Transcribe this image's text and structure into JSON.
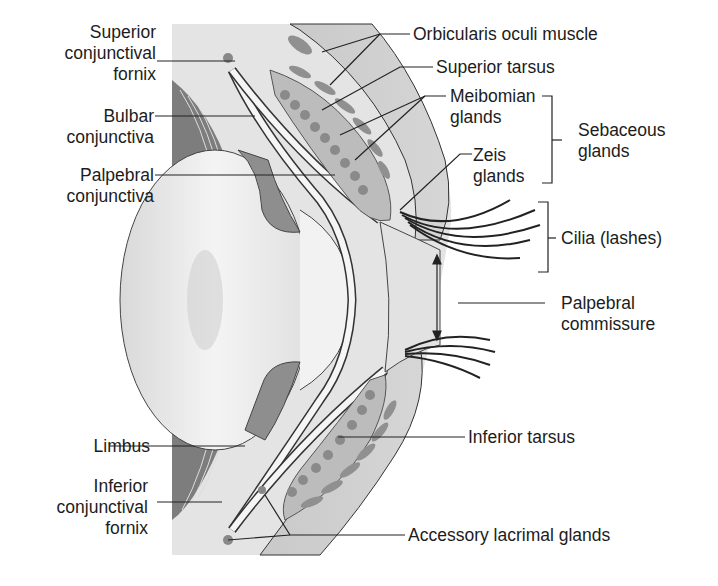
{
  "figure": {
    "colors": {
      "background": "#ffffff",
      "skin": "#cfcfcf",
      "muscle": "#9a9a9a",
      "gland": "#8c8c8c",
      "tarsus": "#bdbdbd",
      "eyeball": "#ececec",
      "dark_tissue": "#7a7a7a",
      "line": "#222222"
    }
  },
  "labels": {
    "left": [
      {
        "id": "superior-conjunctival-fornix",
        "lines": [
          "Superior",
          "conjunctival",
          "fornix"
        ]
      },
      {
        "id": "bulbar-conjunctiva",
        "lines": [
          "Bulbar",
          "conjunctiva"
        ]
      },
      {
        "id": "palpebral-conjunctiva",
        "lines": [
          "Palpebral",
          "conjunctiva"
        ]
      },
      {
        "id": "limbus",
        "lines": [
          "Limbus"
        ]
      },
      {
        "id": "inferior-conjunctival-fornix",
        "lines": [
          "Inferior",
          "conjunctival",
          "fornix"
        ]
      }
    ],
    "right": [
      {
        "id": "orbicularis-oculi-muscle",
        "lines": [
          "Orbicularis oculi muscle"
        ]
      },
      {
        "id": "superior-tarsus",
        "lines": [
          "Superior tarsus"
        ]
      },
      {
        "id": "meibomian-glands",
        "lines": [
          "Meibomian",
          "glands"
        ]
      },
      {
        "id": "zeis-glands",
        "lines": [
          "Zeis",
          "glands"
        ]
      },
      {
        "id": "sebaceous-glands",
        "lines": [
          "Sebaceous",
          "glands"
        ]
      },
      {
        "id": "cilia",
        "lines": [
          "Cilia (lashes)"
        ]
      },
      {
        "id": "palpebral-commissure",
        "lines": [
          "Palpebral",
          "commissure"
        ]
      },
      {
        "id": "inferior-tarsus",
        "lines": [
          "Inferior tarsus"
        ]
      },
      {
        "id": "accessory-lacrimal-glands",
        "lines": [
          "Accessory lacrimal glands"
        ]
      }
    ]
  }
}
